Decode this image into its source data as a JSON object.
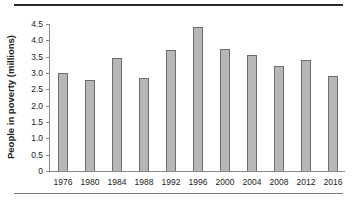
{
  "chart_data": {
    "type": "bar",
    "title": "",
    "xlabel": "",
    "ylabel": "People in poverty (millions)",
    "categories": [
      "1976",
      "1980",
      "1984",
      "1988",
      "1992",
      "1996",
      "2000",
      "2004",
      "2008",
      "2012",
      "2016"
    ],
    "values": [
      3.0,
      2.8,
      3.45,
      2.85,
      3.7,
      4.4,
      3.75,
      3.55,
      3.2,
      3.4,
      2.9
    ],
    "ylim": [
      0,
      4.5
    ],
    "yticks": [
      "0",
      "0.5",
      "1.0",
      "1.5",
      "2.0",
      "2.5",
      "3.0",
      "3.5",
      "4.0",
      "4.5"
    ],
    "grid": false,
    "legend": null,
    "bar_color": "#b7b7b7",
    "bar_edge_color": "#6e6e6e"
  }
}
